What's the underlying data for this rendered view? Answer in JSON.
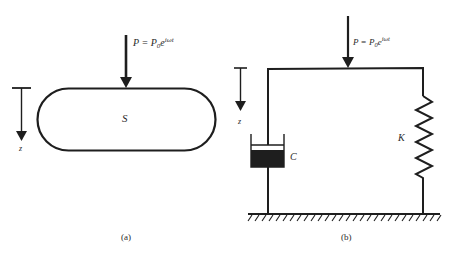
{
  "panel_a": {
    "force_label": "P = P",
    "force_sub": "0",
    "force_exp_base": "e",
    "force_exp": "iωt",
    "body_label": "S",
    "axis_label": "z",
    "caption": "(a)"
  },
  "panel_b": {
    "force_label": "P = P",
    "force_sub": "0",
    "force_exp_base": "e",
    "force_exp": "iωt",
    "damper_label": "C",
    "spring_label": "K",
    "axis_label": "z",
    "caption": "(b)"
  },
  "colors": {
    "stroke": "#1e1e1e",
    "text": "#2a2a2a",
    "background": "#ffffff"
  }
}
